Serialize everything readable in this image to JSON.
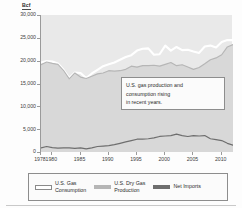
{
  "figure": {
    "unit_label": "Bcf"
  },
  "annotation": {
    "line1": "U.S. gas production and",
    "line2": "consumption rising",
    "line3": "in recent years."
  },
  "legend": {
    "items": [
      {
        "label_line1": "U.S. Gas",
        "label_line2": "Consumption",
        "swatch": "outlined",
        "color": "#ffffff"
      },
      {
        "label_line1": "U.S. Dry Gas",
        "label_line2": "Production",
        "swatch": "solid",
        "color": "#b6b6b6"
      },
      {
        "label_line1": "Net Imports",
        "label_line2": "",
        "swatch": "solid",
        "color": "#6e6e6e"
      }
    ]
  },
  "chart_data": {
    "type": "line",
    "title": "",
    "subtitle": "",
    "xlabel": "",
    "ylabel": "Bcf",
    "ylim": [
      0,
      30000
    ],
    "xlim": [
      1978,
      2012
    ],
    "yticks": [
      0,
      5000,
      10000,
      15000,
      20000,
      25000,
      30000
    ],
    "ytick_labels": [
      "0",
      "5,000",
      "10,000",
      "15,000",
      "20,000",
      "25,000",
      "30,000"
    ],
    "xticks": [
      1978,
      1980,
      1985,
      1990,
      1995,
      2000,
      2005,
      2010
    ],
    "xtick_labels": [
      "1978",
      "1980",
      "1985",
      "1990",
      "1995",
      "2000",
      "2005",
      "2010"
    ],
    "grid": false,
    "legend_position": "bottom",
    "annotations": [
      {
        "text": "U.S. gas production and consumption rising in recent years.",
        "x": 1996,
        "y": 11500
      }
    ],
    "x": [
      1978,
      1979,
      1980,
      1981,
      1982,
      1983,
      1984,
      1985,
      1986,
      1987,
      1988,
      1989,
      1990,
      1991,
      1992,
      1993,
      1994,
      1995,
      1996,
      1997,
      1998,
      1999,
      2000,
      2001,
      2002,
      2003,
      2004,
      2005,
      2006,
      2007,
      2008,
      2009,
      2010,
      2011,
      2012
    ],
    "series": [
      {
        "name": "U.S. Gas Consumption",
        "color": "#ffffff",
        "values": [
          19600,
          19900,
          19800,
          19400,
          18000,
          16200,
          17400,
          17300,
          16200,
          17200,
          18000,
          18800,
          19200,
          19600,
          20200,
          20800,
          21200,
          22200,
          22600,
          22700,
          21300,
          21400,
          23300,
          22200,
          23000,
          22300,
          22400,
          22000,
          21700,
          23100,
          23300,
          22900,
          24100,
          24500,
          24500
        ]
      },
      {
        "name": "U.S. Dry Gas Production",
        "color": "#b6b6b6",
        "values": [
          19100,
          19700,
          19400,
          19200,
          17800,
          16000,
          17300,
          16400,
          16100,
          16600,
          17100,
          17300,
          17800,
          17700,
          17800,
          18100,
          18800,
          18600,
          18900,
          18900,
          19000,
          18800,
          19200,
          19600,
          18900,
          19100,
          18600,
          18100,
          18500,
          19300,
          20200,
          20600,
          21300,
          23000,
          23500
        ]
      },
      {
        "name": "Net Imports",
        "color": "#6e6e6e",
        "values": [
          900,
          1200,
          950,
          850,
          900,
          900,
          800,
          900,
          700,
          900,
          1200,
          1300,
          1400,
          1600,
          1900,
          2200,
          2500,
          2800,
          2800,
          2900,
          3100,
          3400,
          3500,
          3600,
          3900,
          3600,
          3400,
          3600,
          3500,
          3600,
          2900,
          2700,
          2500,
          1900,
          1500
        ]
      }
    ]
  }
}
